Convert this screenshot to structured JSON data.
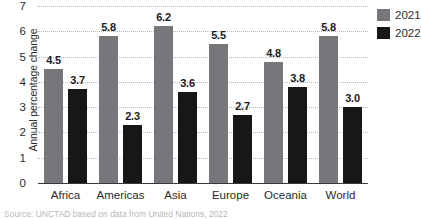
{
  "chart_data": {
    "type": "bar",
    "title": "",
    "xlabel": "",
    "ylabel": "Annual percentage change",
    "ylim": [
      0,
      7
    ],
    "yticks": [
      0,
      1,
      2,
      3,
      4,
      5,
      6,
      7
    ],
    "grid": true,
    "legend_position": "top-right",
    "categories": [
      "Africa",
      "Americas",
      "Asia",
      "Europe",
      "Oceania",
      "World"
    ],
    "series": [
      {
        "name": "2021",
        "color": "#77767a",
        "values": [
          4.5,
          5.8,
          6.2,
          5.5,
          4.8,
          5.8
        ]
      },
      {
        "name": "2022",
        "color": "#181617",
        "values": [
          3.7,
          2.3,
          3.6,
          2.7,
          3.8,
          3.0
        ]
      }
    ],
    "data_labels": {
      "2021": [
        "4.5",
        "5.8",
        "6.2",
        "5.5",
        "4.8",
        "5.8"
      ],
      "2022": [
        "3.7",
        "2.3",
        "3.6",
        "2.7",
        "3.8",
        "3.0"
      ]
    },
    "tick_labels": [
      "0",
      "1",
      "2",
      "3",
      "4",
      "5",
      "6",
      "7"
    ]
  },
  "legend": {
    "items": [
      {
        "label": "2021",
        "swatch": "series-2021-swatch"
      },
      {
        "label": "2022",
        "swatch": "series-2022-swatch"
      }
    ]
  },
  "footer": {
    "source": "Source: UNCTAD based on data from United Nations, 2022"
  }
}
